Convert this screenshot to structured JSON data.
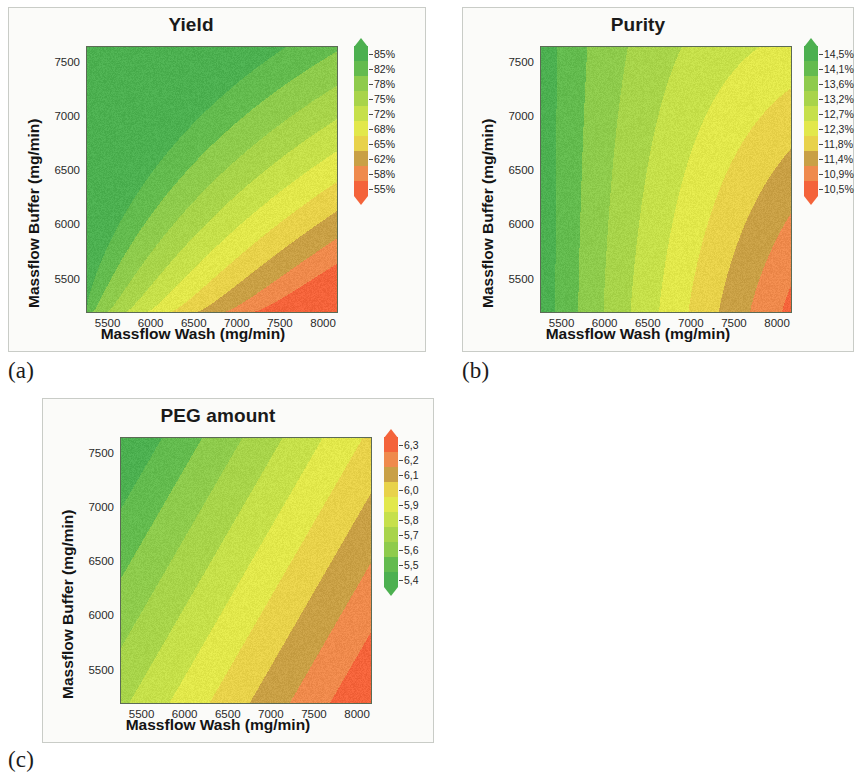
{
  "figure": {
    "subfigure_labels": [
      "(a)",
      "(b)",
      "(c)"
    ]
  },
  "axes_common": {
    "xlabel": "Massflow Wash (mg/min)",
    "ylabel": "Massflow Buffer (mg/min)",
    "xticks": [
      "5500",
      "6000",
      "6500",
      "7000",
      "7500",
      "8000"
    ],
    "yticks": [
      "7500",
      "7000",
      "6500",
      "6000",
      "5500"
    ],
    "xlim": [
      5250,
      8150
    ],
    "ylim": [
      5200,
      7650
    ]
  },
  "chart_data": [
    {
      "type": "heatmap",
      "panel": "(a)",
      "title": "Yield",
      "xlabel": "Massflow Wash (mg/min)",
      "ylabel": "Massflow Buffer (mg/min)",
      "xticks": [
        5500,
        6000,
        6500,
        7000,
        7500,
        8000
      ],
      "yticks": [
        7500,
        7000,
        6500,
        6000,
        5500
      ],
      "xlim": [
        5250,
        8150
      ],
      "ylim": [
        5200,
        7650
      ],
      "grid": false,
      "legend_position": "right",
      "colorbar": {
        "labels": [
          "85%",
          "82%",
          "78%",
          "75%",
          "72%",
          "68%",
          "65%",
          "62%",
          "58%",
          "55%"
        ],
        "values": [
          85,
          82,
          78,
          75,
          72,
          68,
          65,
          62,
          58,
          55
        ],
        "unit": "%",
        "high_color": "#4caf50",
        "low_color": "#f4633a",
        "orientation": "vertical-high-top",
        "arrow_top": true,
        "arrow_bottom": true
      },
      "band_colors": [
        "#4cb050",
        "#63bb4e",
        "#8ecb4c",
        "#a8d44a",
        "#c6e04a",
        "#e2e84b",
        "#e8d24a",
        "#c9a045",
        "#ef8a4c",
        "#f4633a"
      ],
      "description": "Yield is highest (>85%) at low Massflow Wash and high Massflow Buffer (upper-left); lowest (~55%) at high Massflow Wash and low Massflow Buffer (lower-right). Contours are L-shaped / rectangular-stepped."
    },
    {
      "type": "heatmap",
      "panel": "(b)",
      "title": "Purity",
      "xlabel": "Massflow Wash (mg/min)",
      "ylabel": "Massflow Buffer (mg/min)",
      "xticks": [
        5500,
        6000,
        6500,
        7000,
        7500,
        8000
      ],
      "yticks": [
        7500,
        7000,
        6500,
        6000,
        5500
      ],
      "xlim": [
        5250,
        8150
      ],
      "ylim": [
        5200,
        7650
      ],
      "grid": false,
      "legend_position": "right",
      "colorbar": {
        "labels": [
          "14,5%",
          "14,1%",
          "13,6%",
          "13,2%",
          "12,7%",
          "12,3%",
          "11,8%",
          "11,4%",
          "10,9%",
          "10,5%"
        ],
        "values": [
          14.5,
          14.1,
          13.6,
          13.2,
          12.7,
          12.3,
          11.8,
          11.4,
          10.9,
          10.5
        ],
        "unit": "%",
        "high_color": "#4caf50",
        "low_color": "#f4633a",
        "orientation": "vertical-high-top",
        "arrow_top": true,
        "arrow_bottom": true
      },
      "band_colors": [
        "#4cb050",
        "#63bb4e",
        "#8ecb4c",
        "#a8d44a",
        "#c6e04a",
        "#e2e84b",
        "#e8d24a",
        "#c9a045",
        "#ef8a4c",
        "#f4633a"
      ],
      "description": "Purity is highest (~14,5%) at low Massflow Wash (left edge), decreasing toward high Massflow Wash and low Massflow Buffer (lower-right, ~10,5%). Contours are near-vertical at left becoming L-shaped toward lower-right."
    },
    {
      "type": "heatmap",
      "panel": "(c)",
      "title": "PEG amount",
      "xlabel": "Massflow Wash (mg/min)",
      "ylabel": "Massflow Buffer (mg/min)",
      "xticks": [
        5500,
        6000,
        6500,
        7000,
        7500,
        8000
      ],
      "yticks": [
        7500,
        7000,
        6500,
        6000,
        5500
      ],
      "xlim": [
        5250,
        8150
      ],
      "ylim": [
        5200,
        7650
      ],
      "grid": false,
      "legend_position": "right",
      "colorbar": {
        "labels": [
          "6,3",
          "6,2",
          "6,1",
          "6,0",
          "5,9",
          "5,8",
          "5,7",
          "5,6",
          "5,5",
          "5,4"
        ],
        "values": [
          6.3,
          6.2,
          6.1,
          6.0,
          5.9,
          5.8,
          5.7,
          5.6,
          5.5,
          5.4
        ],
        "unit": "",
        "high_color": "#f4633a",
        "low_color": "#4caf50",
        "orientation": "vertical-high-top-reversed",
        "arrow_top": true,
        "arrow_bottom": true
      },
      "band_colors": [
        "#4cb050",
        "#63bb4e",
        "#8ecb4c",
        "#a8d44a",
        "#c6e04a",
        "#e2e84b",
        "#e8d24a",
        "#c9a045",
        "#ef8a4c",
        "#f4633a"
      ],
      "description": "PEG amount increases linearly from upper-left (5,4) to lower-right (6,3) producing straight parallel diagonal bands running from lower-left to upper-right."
    }
  ]
}
